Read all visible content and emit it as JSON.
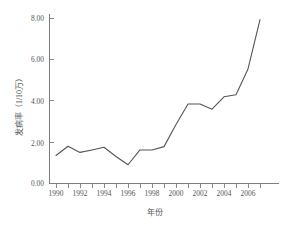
{
  "chart_data": {
    "type": "line",
    "title": "",
    "xlabel": "年份",
    "ylabel": "发病率（1/10万）",
    "x": [
      1990,
      1991,
      1992,
      1993,
      1994,
      1995,
      1996,
      1997,
      1998,
      1999,
      2000,
      2001,
      2002,
      2003,
      2004,
      2005,
      2006,
      2007
    ],
    "values": [
      1.35,
      1.8,
      1.5,
      1.62,
      1.75,
      1.3,
      0.9,
      1.62,
      1.62,
      1.78,
      2.85,
      3.85,
      3.85,
      3.6,
      4.2,
      4.3,
      5.55,
      7.95
    ],
    "series": [
      {
        "name": "发病率",
        "values": [
          1.35,
          1.8,
          1.5,
          1.62,
          1.75,
          1.3,
          0.9,
          1.62,
          1.62,
          1.78,
          2.85,
          3.85,
          3.85,
          3.6,
          4.2,
          4.3,
          5.55,
          7.95
        ]
      }
    ],
    "xlim": [
      1989.5,
      2007.5
    ],
    "ylim": [
      0.0,
      8.0
    ],
    "x_tick_values": [
      1990,
      1991,
      1992,
      1993,
      1994,
      1995,
      1996,
      1997,
      1998,
      1999,
      2000,
      2001,
      2002,
      2003,
      2004,
      2005,
      2006,
      2007
    ],
    "x_tick_labels": [
      "1990",
      "",
      "1992",
      "",
      "1994",
      "",
      "1996",
      "",
      "1998",
      "",
      "2000",
      "",
      "2002",
      "",
      "2004",
      "",
      "2006",
      ""
    ],
    "y_tick_values": [
      0.0,
      2.0,
      4.0,
      6.0,
      8.0
    ],
    "y_tick_labels": [
      "0.00",
      "2.00",
      "4.00",
      "6.00",
      "8.00"
    ],
    "grid": false,
    "legend": false,
    "legend_position": "none",
    "line_color": "#555555",
    "axis_color": "#7d7d7d",
    "background_color": "#ffffff"
  },
  "axes": {
    "y_labels": [
      "8.00",
      "6.00",
      "4.00",
      "2.00",
      "0.00"
    ],
    "x_labels": [
      "1990",
      "1992",
      "1994",
      "1996",
      "1998",
      "2000",
      "2002",
      "2004",
      "2006"
    ],
    "x_title": "年份",
    "y_title": "发病率（1/10万）"
  }
}
